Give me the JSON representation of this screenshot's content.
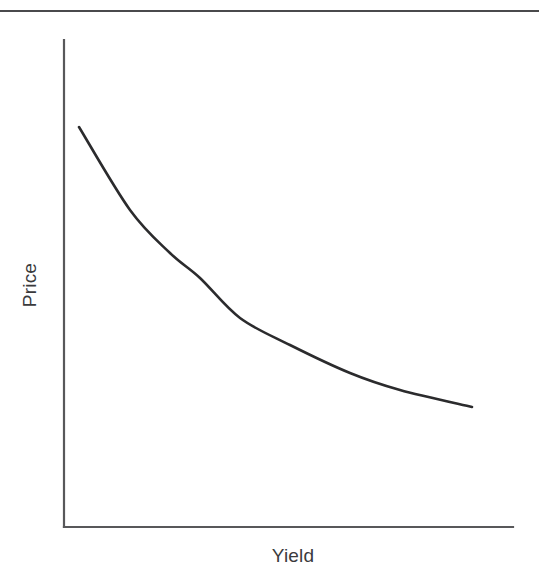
{
  "figure": {
    "background_color": "#ffffff",
    "top_rule": {
      "name": "page-rule",
      "color": "#3b3b3d"
    }
  },
  "chart_data": {
    "type": "line",
    "title": "",
    "subtitle": "",
    "xlabel": "Yield",
    "ylabel": "Price",
    "legend": [],
    "legend_position": "none",
    "grid": false,
    "axis_ticks": false,
    "tick_labels": [],
    "annotations": [],
    "xlim": [
      0,
      100
    ],
    "ylim": [
      0,
      100
    ],
    "axis_color": "#58585a",
    "line_color": "#2b2b2d",
    "series": [
      {
        "name": "price-yield-curve",
        "x": [
          3.5,
          15.0,
          23.6,
          30.3,
          39.2,
          50.4,
          63.7,
          74.9,
          90.9
        ],
        "y": [
          82.1,
          65.1,
          56.3,
          51.1,
          42.9,
          37.4,
          31.6,
          28.1,
          24.6
        ],
        "points_px": [
          [
            79,
            127
          ],
          [
            130,
            210
          ],
          [
            170,
            253
          ],
          [
            200,
            278
          ],
          [
            240,
            318
          ],
          [
            290,
            345
          ],
          [
            350,
            373
          ],
          [
            400,
            390
          ],
          [
            472,
            407
          ]
        ]
      }
    ]
  },
  "labels": {
    "y_axis_label": "Price",
    "x_axis_label": "Yield"
  }
}
